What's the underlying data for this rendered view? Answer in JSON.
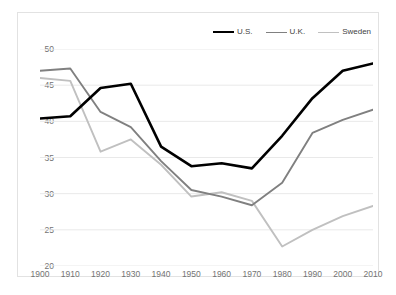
{
  "chart_data": {
    "type": "line",
    "title": "",
    "subtitle": "",
    "xlabel": "",
    "ylabel": "",
    "x": [
      1900,
      1910,
      1920,
      1930,
      1940,
      1950,
      1960,
      1970,
      1980,
      1990,
      2000,
      2010
    ],
    "xtick_labels": [
      "1900",
      "1910",
      "1920",
      "1930",
      "1940",
      "1950",
      "1960",
      "1970",
      "1980",
      "1990",
      "2000",
      "2010"
    ],
    "ytick_labels": [
      "50",
      "45",
      "40",
      "35",
      "30",
      "25",
      "20"
    ],
    "yticks": [
      50,
      45,
      40,
      35,
      30,
      25,
      20
    ],
    "ylim": [
      20,
      50
    ],
    "xlim": [
      1900,
      2010
    ],
    "grid": "horizontal",
    "legend_position": "top-right",
    "series": [
      {
        "name": "U.S.",
        "color": "#000000",
        "width": 2.6,
        "values": [
          40.4,
          40.7,
          44.6,
          45.2,
          36.5,
          33.8,
          34.2,
          33.5,
          38.0,
          43.2,
          47.0,
          48.0
        ]
      },
      {
        "name": "U.K.",
        "color": "#808080",
        "width": 1.9,
        "values": [
          47.0,
          47.3,
          41.3,
          39.2,
          34.5,
          30.5,
          29.6,
          28.4,
          31.5,
          38.4,
          40.2,
          41.6
        ]
      },
      {
        "name": "Sweden",
        "color": "#c0c0c0",
        "width": 1.9,
        "values": [
          46.0,
          45.6,
          35.8,
          37.5,
          34.0,
          29.6,
          30.2,
          29.0,
          22.7,
          25.0,
          26.9,
          28.3
        ]
      }
    ]
  },
  "legend": {
    "items": [
      {
        "label": "U.S.",
        "color": "#000000"
      },
      {
        "label": "U.K.",
        "color": "#808080"
      },
      {
        "label": "Sweden",
        "color": "#c0c0c0"
      }
    ]
  },
  "colors": {
    "grid": "#e9e9e9",
    "border": "#e2e2e2",
    "tick_text": "#737373",
    "legend_text": "#3f3f3f",
    "background": "#ffffff"
  }
}
